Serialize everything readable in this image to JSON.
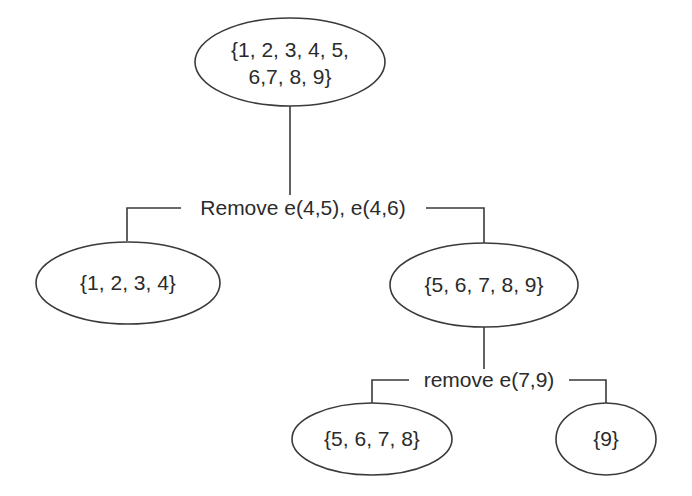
{
  "diagram": {
    "type": "tree",
    "nodes": [
      {
        "id": "root",
        "lines": [
          "{1, 2, 3, 4, 5,",
          "6,7, 8, 9}"
        ]
      },
      {
        "id": "left",
        "lines": [
          "{1, 2, 3, 4}"
        ]
      },
      {
        "id": "right",
        "lines": [
          "{5, 6, 7, 8, 9}"
        ]
      },
      {
        "id": "right-left",
        "lines": [
          "{5, 6, 7, 8}"
        ]
      },
      {
        "id": "right-right",
        "lines": [
          "{9}"
        ]
      }
    ],
    "splits": [
      {
        "from": "root",
        "to": [
          "left",
          "right"
        ],
        "label": "Remove e(4,5), e(4,6)"
      },
      {
        "from": "right",
        "to": [
          "right-left",
          "right-right"
        ],
        "label": "remove e(7,9)"
      }
    ],
    "colors": {
      "stroke": "#3a3a3a",
      "text": "#2b2b2b",
      "background": "#ffffff"
    }
  }
}
